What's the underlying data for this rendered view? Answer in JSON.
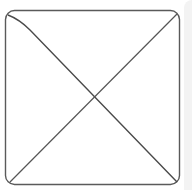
{
  "placeholder": {
    "kind": "image-placeholder",
    "icon": "crossed-box-icon",
    "stroke_color": "#555555",
    "background_color": "#ffffff",
    "edge_color": "#f3f3f3"
  }
}
